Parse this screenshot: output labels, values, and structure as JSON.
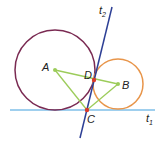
{
  "diagram": {
    "colors": {
      "circle_a": "#7a2a52",
      "circle_b": "#e8954a",
      "tangent_t1": "#7fbfe8",
      "tangent_t2": "#2d3f95",
      "triangle": "#9ccc5a",
      "point_center": "#9ccc5a",
      "point_tangent": "#d93a2b"
    },
    "labels": {
      "A": "A",
      "B": "B",
      "C": "C",
      "D": "D",
      "t1_main": "t",
      "t1_sub": "1",
      "t2_main": "t",
      "t2_sub": "2"
    },
    "circles": [
      {
        "name": "circle-A",
        "cx": 55,
        "cy": 70,
        "r": 40
      },
      {
        "name": "circle-B",
        "cx": 118,
        "cy": 84,
        "r": 25
      }
    ],
    "points": {
      "A": [
        55,
        70
      ],
      "B": [
        118,
        84
      ],
      "C": [
        87,
        110
      ],
      "D": [
        94,
        80
      ]
    },
    "lines": {
      "t1": [
        [
          10,
          110
        ],
        [
          155,
          110
        ]
      ],
      "t2": [
        [
          112,
          7
        ],
        [
          80,
          138
        ]
      ]
    }
  }
}
